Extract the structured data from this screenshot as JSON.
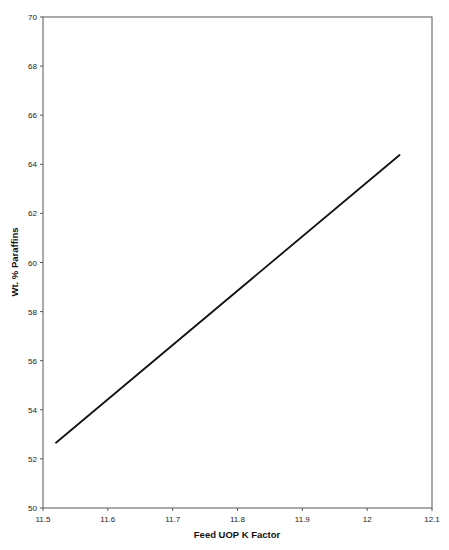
{
  "chart_data": {
    "type": "line",
    "title": "",
    "xlabel": "Feed UOP K Factor",
    "ylabel": "Wt. % Paraffins",
    "xlim": [
      11.5,
      12.1
    ],
    "ylim": [
      50,
      70
    ],
    "x_ticks": [
      "11.5",
      "11.6",
      "11.7",
      "11.8",
      "11.9",
      "12",
      "12.1"
    ],
    "y_ticks": [
      "50",
      "52",
      "54",
      "56",
      "58",
      "60",
      "62",
      "64",
      "66",
      "68",
      "70"
    ],
    "grid": false,
    "legend": null,
    "series": [
      {
        "name": "Wt. % Paraffins",
        "x": [
          11.52,
          12.05
        ],
        "y": [
          52.66,
          64.38
        ]
      }
    ],
    "colors": {
      "line": "#111111",
      "axis": "#555555"
    }
  }
}
